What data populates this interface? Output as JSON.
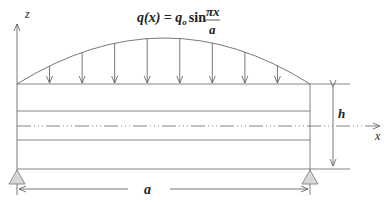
{
  "diagram": {
    "load_equation": {
      "lhs": "q(x) = q",
      "sub": "o",
      "mid": "sin",
      "num": "πx",
      "den": "a"
    },
    "axis_z_label": "z",
    "axis_x_label": "x",
    "height_label": "h",
    "length_label": "a",
    "load_arrow_count": 8,
    "colors": {
      "line": "#555555",
      "support_fill": "#d8d8d8"
    }
  }
}
